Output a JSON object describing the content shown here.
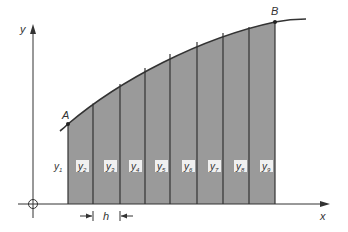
{
  "diagram": {
    "axes": {
      "x_label": "x",
      "y_label": "y"
    },
    "points": {
      "start_label": "A",
      "end_label": "B"
    },
    "strip_width_label": "h",
    "ordinates": [
      {
        "name": "y",
        "sub": "1"
      },
      {
        "name": "y",
        "sub": "2"
      },
      {
        "name": "y",
        "sub": "3"
      },
      {
        "name": "y",
        "sub": "4"
      },
      {
        "name": "y",
        "sub": "5"
      },
      {
        "name": "y",
        "sub": "6"
      },
      {
        "name": "y",
        "sub": "7"
      },
      {
        "name": "y",
        "sub": "8"
      },
      {
        "name": "y",
        "sub": "9"
      }
    ],
    "strip_count": 8,
    "colors": {
      "fill": "#9a9a9a",
      "stroke": "#333333",
      "background": "#ffffff"
    }
  }
}
